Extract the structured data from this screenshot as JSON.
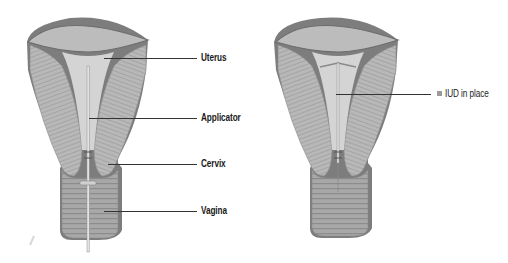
{
  "figures": [
    {
      "id": "insertion",
      "description": "Cross-section of uterus with IUD applicator being inserted through vagina and cervix",
      "labels": [
        {
          "text": "Uterus",
          "y": 58
        },
        {
          "text": "Applicator",
          "y": 118
        },
        {
          "text": "Cervix",
          "y": 164
        },
        {
          "text": "Vagina",
          "y": 211
        }
      ]
    },
    {
      "id": "in-place",
      "description": "Cross-section of uterus with T-shaped IUD in place",
      "labels": [
        {
          "text": "IUD in place",
          "y": 94
        }
      ]
    }
  ],
  "colors": {
    "tissue": "#b9b9b9",
    "tissue_dark": "#7d7d7d",
    "cavity": "#d9d9d9",
    "leader_line": "#333333",
    "bullet": "#9a9a9a"
  }
}
